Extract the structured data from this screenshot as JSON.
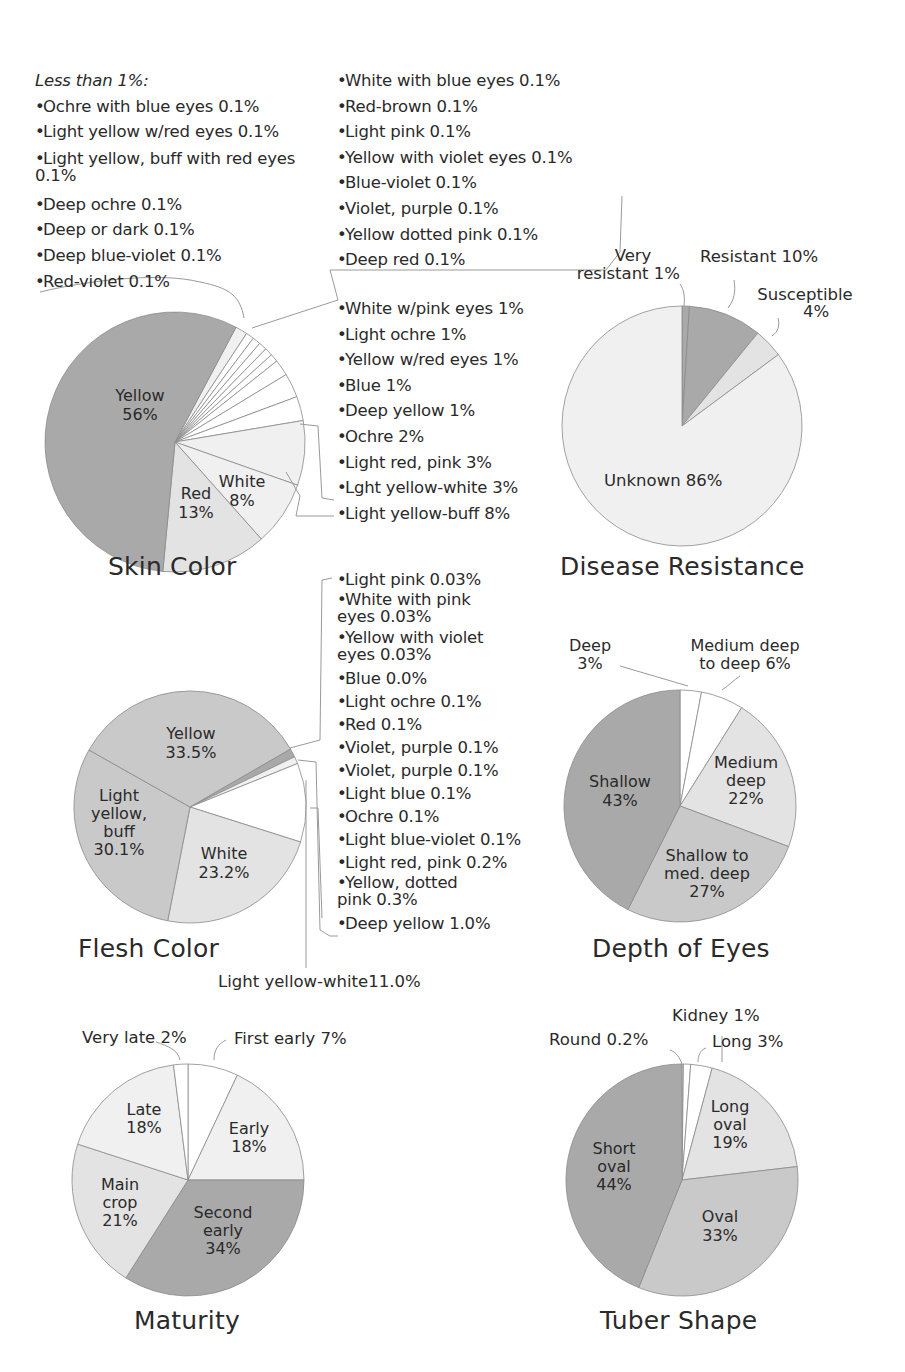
{
  "colors": {
    "dark": "#a9a9a9",
    "mid": "#c9c9c9",
    "light": "#e3e3e3",
    "pale": "#f0f0f0",
    "white": "#ffffff",
    "stroke": "#8a8a8a",
    "text": "#2a2a2a"
  },
  "skin_color": {
    "title": "Skin Color",
    "less_than_header": "Less than 1%:",
    "less_than_list_left": [
      "Ochre with blue eyes 0.1%",
      "Light yellow w/red eyes 0.1%",
      "Light yellow, buff with red eyes 0.1%",
      "Deep ochre 0.1%",
      "Deep or dark 0.1%",
      "Deep blue-violet 0.1%",
      "Red-violet 0.1%"
    ],
    "less_than_list_right": [
      "White with blue eyes 0.1%",
      "Red-brown 0.1%",
      "Light pink 0.1%",
      "Yellow with violet eyes 0.1%",
      "Blue-violet 0.1%",
      "Violet, purple 0.1%",
      "Yellow dotted pink 0.1%",
      "Deep red 0.1%"
    ],
    "minor_list": [
      "White w/pink eyes 1%",
      "Light ochre 1%",
      "Yellow w/red eyes 1%",
      "Blue 1%",
      "Deep yellow 1%",
      "Ochre 2%",
      "Light red, pink 3%",
      "Lght yellow-white 3%",
      "Light yellow-buff 8%"
    ],
    "labels": {
      "yellow": [
        "Yellow",
        "56%"
      ],
      "red": [
        "Red",
        "13%"
      ],
      "white": [
        "White",
        "8%"
      ]
    }
  },
  "disease_resistance": {
    "title": "Disease Resistance",
    "labels": {
      "very_resistant": [
        "Very",
        "resistant 1%"
      ],
      "resistant": "Resistant 10%",
      "susceptible": [
        "Susceptible",
        "4%"
      ],
      "unknown": "Unknown 86%"
    }
  },
  "flesh_color": {
    "title": "Flesh Color",
    "minor_list": [
      "Light pink 0.03%",
      "White with pink eyes 0.03%",
      "Yellow with violet eyes 0.03%",
      "Blue 0.0%",
      "Light ochre 0.1%",
      "Red 0.1%",
      "Violet, purple 0.1%",
      "Violet, purple 0.1%",
      "Light blue 0.1%",
      "Ochre 0.1%",
      "Light blue-violet 0.1%",
      "Light red, pink 0.2%",
      "Yellow, dotted pink 0.3%",
      "Deep yellow 1.0%"
    ],
    "wrapped_items": [
      1,
      2,
      12
    ],
    "callout": "Light yellow-white11.0%",
    "labels": {
      "yellow": [
        "Yellow",
        "33.5%"
      ],
      "buff": [
        "Light",
        "yellow,",
        "buff",
        "30.1%"
      ],
      "white": [
        "White",
        "23.2%"
      ]
    }
  },
  "depth_of_eyes": {
    "title": "Depth of Eyes",
    "labels": {
      "deep": [
        "Deep",
        "3%"
      ],
      "medium_deep_to_deep": [
        "Medium deep",
        "to deep 6%"
      ],
      "medium_deep": [
        "Medium",
        "deep",
        "22%"
      ],
      "shallow_to_med": [
        "Shallow to",
        "med. deep",
        "27%"
      ],
      "shallow": [
        "Shallow",
        "43%"
      ]
    }
  },
  "maturity": {
    "title": "Maturity",
    "labels": {
      "very_late": "Very late 2%",
      "first_early": "First early 7%",
      "early": [
        "Early",
        "18%"
      ],
      "second_early": [
        "Second",
        "early",
        "34%"
      ],
      "main_crop": [
        "Main",
        "crop",
        "21%"
      ],
      "late": [
        "Late",
        "18%"
      ]
    }
  },
  "tuber_shape": {
    "title": "Tuber Shape",
    "labels": {
      "kidney": "Kidney 1%",
      "round": "Round 0.2%",
      "long": "Long 3%",
      "long_oval": [
        "Long",
        "oval",
        "19%"
      ],
      "oval": [
        "Oval",
        "33%"
      ],
      "short_oval": [
        "Short",
        "oval",
        "44%"
      ]
    }
  },
  "chart_data": [
    {
      "type": "pie",
      "title": "Skin Color",
      "center": [
        175,
        442
      ],
      "radius": 130,
      "start_angle": 28,
      "slices": [
        {
          "label": "Less than 1% (15 varieties @0.1%)",
          "value": 1.5,
          "fill": "pale"
        },
        {
          "label": "White w/pink eyes",
          "value": 1,
          "fill": "white"
        },
        {
          "label": "Light ochre",
          "value": 1,
          "fill": "white"
        },
        {
          "label": "Yellow w/red eyes",
          "value": 1,
          "fill": "white"
        },
        {
          "label": "Blue",
          "value": 1,
          "fill": "white"
        },
        {
          "label": "Deep yellow",
          "value": 1,
          "fill": "white"
        },
        {
          "label": "Ochre",
          "value": 2,
          "fill": "white"
        },
        {
          "label": "Light red, pink",
          "value": 3,
          "fill": "white"
        },
        {
          "label": "Lght yellow-white",
          "value": 3,
          "fill": "white"
        },
        {
          "label": "Light yellow-buff",
          "value": 8,
          "fill": "pale"
        },
        {
          "label": "White",
          "value": 8,
          "fill": "pale"
        },
        {
          "label": "Red",
          "value": 13,
          "fill": "light"
        },
        {
          "label": "Yellow",
          "value": 56,
          "fill": "dark"
        }
      ]
    },
    {
      "type": "pie",
      "title": "Disease Resistance",
      "center": [
        682,
        426
      ],
      "radius": 120,
      "start_angle": 0,
      "slices": [
        {
          "label": "Very resistant",
          "value": 1,
          "fill": "dark"
        },
        {
          "label": "Resistant",
          "value": 10,
          "fill": "dark"
        },
        {
          "label": "Susceptible",
          "value": 4,
          "fill": "light"
        },
        {
          "label": "Unknown",
          "value": 86,
          "fill": "pale"
        }
      ]
    },
    {
      "type": "pie",
      "title": "Flesh Color",
      "center": [
        190,
        807
      ],
      "radius": 116,
      "start_angle": 60,
      "slices": [
        {
          "label": "Minor colors (<1%)",
          "value": 1.22,
          "fill": "dark"
        },
        {
          "label": "Deep yellow",
          "value": 1.0,
          "fill": "pale"
        },
        {
          "label": "Light yellow-white",
          "value": 11.0,
          "fill": "white"
        },
        {
          "label": "White",
          "value": 23.2,
          "fill": "light"
        },
        {
          "label": "Light yellow, buff",
          "value": 30.1,
          "fill": "mid"
        },
        {
          "label": "Yellow",
          "value": 33.5,
          "fill": "mid"
        }
      ]
    },
    {
      "type": "pie",
      "title": "Depth of Eyes",
      "center": [
        680,
        806
      ],
      "radius": 116,
      "start_angle": 0,
      "slices": [
        {
          "label": "Deep",
          "value": 3,
          "fill": "white"
        },
        {
          "label": "Medium deep to deep",
          "value": 6,
          "fill": "white"
        },
        {
          "label": "Medium deep",
          "value": 22,
          "fill": "light"
        },
        {
          "label": "Shallow to med. deep",
          "value": 27,
          "fill": "mid"
        },
        {
          "label": "Shallow",
          "value": 43,
          "fill": "dark"
        }
      ]
    },
    {
      "type": "pie",
      "title": "Maturity",
      "center": [
        188,
        1180
      ],
      "radius": 116,
      "start_angle": 0,
      "slices": [
        {
          "label": "First early",
          "value": 7,
          "fill": "white"
        },
        {
          "label": "Early",
          "value": 18,
          "fill": "pale"
        },
        {
          "label": "Second early",
          "value": 34,
          "fill": "dark"
        },
        {
          "label": "Main crop",
          "value": 21,
          "fill": "light"
        },
        {
          "label": "Late",
          "value": 18,
          "fill": "pale"
        },
        {
          "label": "Very late",
          "value": 2,
          "fill": "white"
        }
      ]
    },
    {
      "type": "pie",
      "title": "Tuber Shape",
      "center": [
        682,
        1180
      ],
      "radius": 116,
      "start_angle": 0,
      "slices": [
        {
          "label": "Round",
          "value": 0.2,
          "fill": "white"
        },
        {
          "label": "Kidney",
          "value": 1,
          "fill": "white"
        },
        {
          "label": "Long",
          "value": 3,
          "fill": "white"
        },
        {
          "label": "Long oval",
          "value": 19,
          "fill": "light"
        },
        {
          "label": "Oval",
          "value": 33,
          "fill": "mid"
        },
        {
          "label": "Short oval",
          "value": 44,
          "fill": "dark"
        }
      ]
    }
  ]
}
